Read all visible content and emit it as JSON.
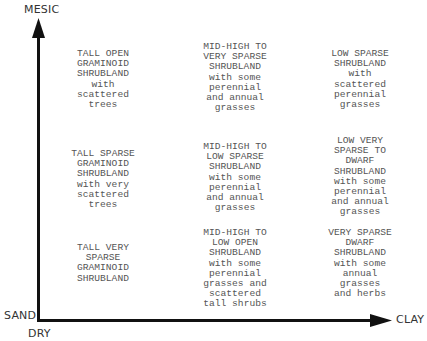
{
  "axes": {
    "y_top_label": "MESIC",
    "origin_left_label": "SAND",
    "origin_bottom_label": "DRY",
    "x_right_label": "CLAY"
  },
  "grid": {
    "rows": [
      {
        "cells": [
          {
            "text": "TALL OPEN\nGRAMINOID\nSHRUBLAND\nwith\nscattered\ntrees"
          },
          {
            "text": "MID-HIGH TO\nVERY SPARSE\nSHRUBLAND\nwith some\nperennial\nand  annual\ngrasses"
          },
          {
            "text": "LOW SPARSE\nSHRUBLAND\nwith\nscattered\nperennial\ngrasses"
          }
        ]
      },
      {
        "cells": [
          {
            "text": "TALL SPARSE\nGRAMINOID\nSHRUBLAND\nwith very\nscattered\ntrees"
          },
          {
            "text": "MID-HIGH TO\nLOW  SPARSE\nSHRUBLAND\nwith some\nperennial\nand annual\ngrasses"
          },
          {
            "text": "LOW  VERY\nSPARSE TO\nDWARF\nSHRUBLAND\nwith some\nperennial\nand annual\ngrasses"
          }
        ]
      },
      {
        "cells": [
          {
            "text": "TALL VERY\nSPARSE\nGRAMINOID\nSHRUBLAND"
          },
          {
            "text": "MID-HIGH TO\nLOW  OPEN\nSHRUBLAND\nwith some\nperennial\ngrasses and\nscattered\ntall shrubs"
          },
          {
            "text": "VERY SPARSE\nDWARF\nSHRUBLAND\nwith some\nannual\ngrasses\nand herbs"
          }
        ]
      }
    ]
  }
}
